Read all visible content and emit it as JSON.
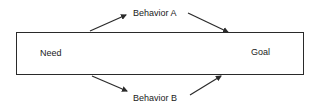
{
  "diagram": {
    "type": "flow",
    "box": {
      "left_label": "Need",
      "right_label": "Goal"
    },
    "paths": [
      {
        "label": "Behavior A",
        "position": "above"
      },
      {
        "label": "Behavior B",
        "position": "below"
      }
    ],
    "colors": {
      "stroke": "#2a2a2a",
      "text": "#1a1a1a",
      "background": "#ffffff"
    }
  }
}
